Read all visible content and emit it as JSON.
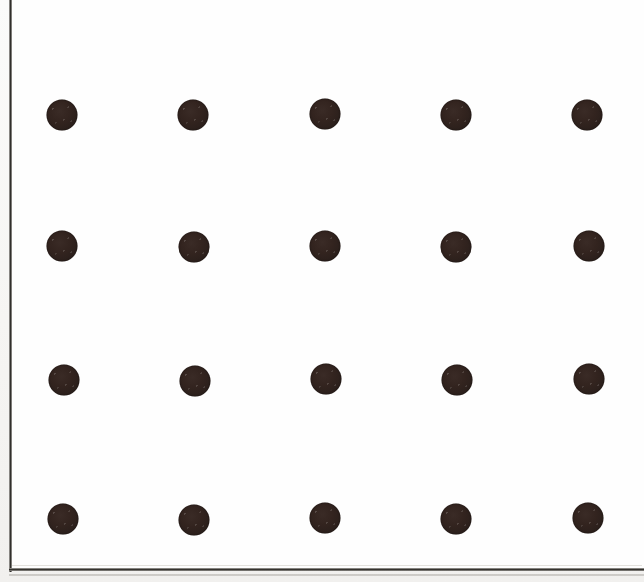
{
  "figure": {
    "title": "",
    "page_background_color": "#f4f3f1",
    "plot_background_color": "#fefefe",
    "rule_color": "#2c2a27"
  },
  "frame": {
    "left_rule_visible": true,
    "bottom_rule_visible": true,
    "top_rule_visible": false,
    "right_rule_visible": false
  },
  "chart_data": {
    "type": "scatter",
    "title": "",
    "subtitle": "",
    "xlabel": "",
    "ylabel": "",
    "xlim": [
      0,
      644
    ],
    "ylim": [
      0,
      582
    ],
    "grid": false,
    "legend": null,
    "tick_labels_x": [],
    "tick_labels_y": [],
    "annotations": [],
    "marker": {
      "shape": "circle",
      "fill_color": "#2c201c",
      "diameter_px": 31,
      "edge_color": "#261c18"
    },
    "layout": {
      "rows": 4,
      "columns": 5,
      "total_points": 20,
      "column_centers_x": [
        62,
        193,
        325,
        456,
        587
      ],
      "row_centers_y": [
        115,
        246,
        380,
        519
      ],
      "column_spacing_px": 131,
      "row_spacing_px": 135
    },
    "points": [
      {
        "id": "r1c1",
        "row": 1,
        "col": 1,
        "x": 62,
        "y": 115
      },
      {
        "id": "r1c2",
        "row": 1,
        "col": 2,
        "x": 193,
        "y": 115
      },
      {
        "id": "r1c3",
        "row": 1,
        "col": 3,
        "x": 325,
        "y": 114
      },
      {
        "id": "r1c4",
        "row": 1,
        "col": 4,
        "x": 456,
        "y": 115
      },
      {
        "id": "r1c5",
        "row": 1,
        "col": 5,
        "x": 587,
        "y": 115
      },
      {
        "id": "r2c1",
        "row": 2,
        "col": 1,
        "x": 62,
        "y": 246
      },
      {
        "id": "r2c2",
        "row": 2,
        "col": 2,
        "x": 194,
        "y": 247
      },
      {
        "id": "r2c3",
        "row": 2,
        "col": 3,
        "x": 325,
        "y": 246
      },
      {
        "id": "r2c4",
        "row": 2,
        "col": 4,
        "x": 456,
        "y": 247
      },
      {
        "id": "r2c5",
        "row": 2,
        "col": 5,
        "x": 589,
        "y": 246
      },
      {
        "id": "r3c1",
        "row": 3,
        "col": 1,
        "x": 64,
        "y": 380
      },
      {
        "id": "r3c2",
        "row": 3,
        "col": 2,
        "x": 195,
        "y": 381
      },
      {
        "id": "r3c3",
        "row": 3,
        "col": 3,
        "x": 326,
        "y": 379
      },
      {
        "id": "r3c4",
        "row": 3,
        "col": 4,
        "x": 457,
        "y": 380
      },
      {
        "id": "r3c5",
        "row": 3,
        "col": 5,
        "x": 589,
        "y": 379
      },
      {
        "id": "r4c1",
        "row": 4,
        "col": 1,
        "x": 63,
        "y": 519
      },
      {
        "id": "r4c2",
        "row": 4,
        "col": 2,
        "x": 194,
        "y": 520
      },
      {
        "id": "r4c3",
        "row": 4,
        "col": 3,
        "x": 325,
        "y": 518
      },
      {
        "id": "r4c4",
        "row": 4,
        "col": 4,
        "x": 456,
        "y": 519
      },
      {
        "id": "r4c5",
        "row": 4,
        "col": 5,
        "x": 588,
        "y": 518
      }
    ]
  }
}
